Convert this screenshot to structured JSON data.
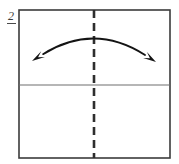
{
  "figure": {
    "step_label": "2",
    "background_color": "#ffffff",
    "stroke_color": "#3b3b3b",
    "divider_color": "#6e6e6e",
    "dash_color": "#2e2e2e",
    "arrow_color": "#141414",
    "sheet": {
      "name": "paper-sheet",
      "x": 19,
      "y": 10,
      "width": 151,
      "height": 148,
      "stroke_width": 1.6
    },
    "horizontal_divider": {
      "name": "horizontal-crease",
      "x1": 19,
      "y1": 85,
      "x2": 170,
      "y2": 85,
      "stroke_width": 1.1
    },
    "vertical_dashed_fold": {
      "name": "vertical-fold-line",
      "x": 94,
      "y_start": 10,
      "y_end": 158,
      "stroke_width": 2.6,
      "dash_length": 8,
      "gap_length": 5
    },
    "fold_arrow": {
      "name": "fold-direction-arrow",
      "start_x": 32,
      "start_y": 61,
      "end_x": 156,
      "end_y": 62,
      "apex_x": 94,
      "apex_y": 42,
      "stroke_width": 1.8,
      "double_headed": true,
      "head_length": 13,
      "head_width": 7
    }
  }
}
